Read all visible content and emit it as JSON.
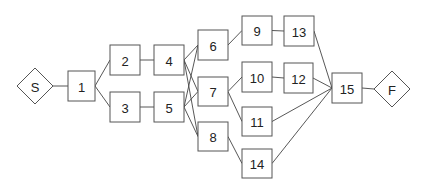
{
  "diagram": {
    "type": "activity-network",
    "nodes": [
      {
        "id": "S",
        "label": "S",
        "shape": "diamond",
        "cx": 35,
        "cy": 86,
        "r": 18
      },
      {
        "id": "1",
        "label": "1",
        "shape": "box",
        "x": 68,
        "y": 71,
        "w": 27,
        "h": 30
      },
      {
        "id": "2",
        "label": "2",
        "shape": "box",
        "x": 110,
        "y": 45,
        "w": 30,
        "h": 30
      },
      {
        "id": "3",
        "label": "3",
        "shape": "box",
        "x": 110,
        "y": 92,
        "w": 30,
        "h": 30
      },
      {
        "id": "4",
        "label": "4",
        "shape": "box",
        "x": 154,
        "y": 45,
        "w": 30,
        "h": 30
      },
      {
        "id": "5",
        "label": "5",
        "shape": "box",
        "x": 154,
        "y": 92,
        "w": 30,
        "h": 30
      },
      {
        "id": "6",
        "label": "6",
        "shape": "box",
        "x": 198,
        "y": 30,
        "w": 30,
        "h": 30
      },
      {
        "id": "7",
        "label": "7",
        "shape": "box",
        "x": 198,
        "y": 77,
        "w": 30,
        "h": 29
      },
      {
        "id": "8",
        "label": "8",
        "shape": "box",
        "x": 198,
        "y": 122,
        "w": 30,
        "h": 29
      },
      {
        "id": "9",
        "label": "9",
        "shape": "box",
        "x": 242,
        "y": 16,
        "w": 30,
        "h": 29
      },
      {
        "id": "10",
        "label": "10",
        "shape": "box",
        "x": 242,
        "y": 62,
        "w": 30,
        "h": 30
      },
      {
        "id": "11",
        "label": "11",
        "shape": "box",
        "x": 242,
        "y": 107,
        "w": 30,
        "h": 29
      },
      {
        "id": "14",
        "label": "14",
        "shape": "box",
        "x": 242,
        "y": 149,
        "w": 30,
        "h": 29
      },
      {
        "id": "13",
        "label": "13",
        "shape": "box",
        "x": 284,
        "y": 16,
        "w": 30,
        "h": 30
      },
      {
        "id": "12",
        "label": "12",
        "shape": "box",
        "x": 284,
        "y": 63,
        "w": 29,
        "h": 30
      },
      {
        "id": "15",
        "label": "15",
        "shape": "box",
        "x": 332,
        "y": 73,
        "w": 30,
        "h": 30
      },
      {
        "id": "F",
        "label": "F",
        "shape": "diamond",
        "cx": 392,
        "cy": 89,
        "r": 18
      }
    ],
    "edges": [
      [
        "S",
        "1"
      ],
      [
        "1",
        "2"
      ],
      [
        "1",
        "3"
      ],
      [
        "2",
        "4"
      ],
      [
        "3",
        "5"
      ],
      [
        "4",
        "6"
      ],
      [
        "4",
        "7"
      ],
      [
        "4",
        "8"
      ],
      [
        "5",
        "6"
      ],
      [
        "5",
        "7"
      ],
      [
        "5",
        "8"
      ],
      [
        "6",
        "9"
      ],
      [
        "7",
        "10"
      ],
      [
        "7",
        "11"
      ],
      [
        "8",
        "14"
      ],
      [
        "9",
        "13"
      ],
      [
        "10",
        "12"
      ],
      [
        "13",
        "15"
      ],
      [
        "12",
        "15"
      ],
      [
        "11",
        "15"
      ],
      [
        "14",
        "15"
      ],
      [
        "15",
        "F"
      ]
    ]
  }
}
